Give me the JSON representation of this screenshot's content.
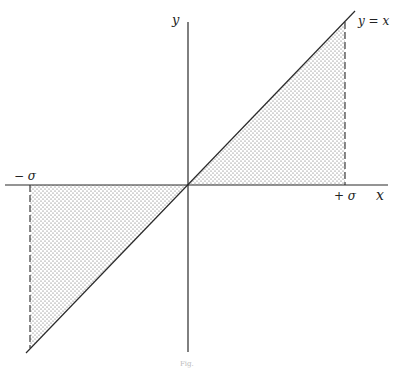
{
  "diagram": {
    "type": "function-plot",
    "axes": {
      "x_label": "x",
      "y_label": "y"
    },
    "curve_label": "y = x",
    "markers": {
      "negative": "− σ",
      "positive": "+ σ"
    },
    "shaded_regions": [
      {
        "description": "triangle between y=x, x-axis and x=+σ",
        "quadrant": "I"
      },
      {
        "description": "triangle between y=x, x-axis and x=−σ",
        "quadrant": "III"
      }
    ],
    "caption": "Fig."
  },
  "colors": {
    "line": "#2a2a2a",
    "stipple": "#555555",
    "background": "#ffffff"
  }
}
